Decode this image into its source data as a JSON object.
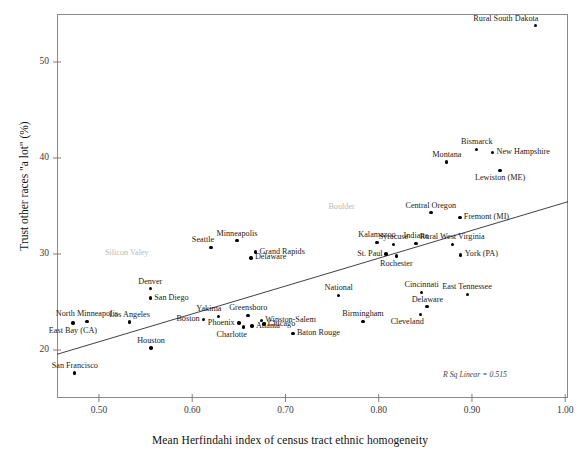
{
  "chart_data": {
    "type": "scatter",
    "title": "",
    "xlabel": "Mean Herfindahi index of census tract ethnic homogeneity",
    "ylabel": "Trust other races \"a lot\" (%)",
    "xlim": [
      0.455,
      1.003
    ],
    "ylim": [
      15.0,
      55.0
    ],
    "xticks": [
      "0.50",
      "0.60",
      "0.70",
      "0.80",
      "0.90",
      "1.00"
    ],
    "xtick_values": [
      0.5,
      0.6,
      0.7,
      0.8,
      0.9,
      1.0
    ],
    "yticks": [
      "20",
      "30",
      "40",
      "50"
    ],
    "ytick_values": [
      20,
      30,
      40,
      50
    ],
    "grid": false,
    "legend": null,
    "annotation": "R Sq Linear = 0.515",
    "fit_line": {
      "type": "linear",
      "x0": 0.455,
      "y0": 19.55,
      "x1": 1.003,
      "y1": 35.45
    },
    "points": [
      {
        "label": "Rural South Dakota",
        "x": 0.968,
        "y": 53.8,
        "pos": "above-left",
        "ghost": false
      },
      {
        "label": "Bismarck",
        "x": 0.905,
        "y": 40.9,
        "pos": "above",
        "ghost": false
      },
      {
        "label": "New Hampshire",
        "x": 0.922,
        "y": 40.6,
        "pos": "right",
        "ghost": false
      },
      {
        "label": "Montana",
        "x": 0.873,
        "y": 39.6,
        "pos": "above",
        "ghost": false
      },
      {
        "label": "Lewiston (ME)",
        "x": 0.93,
        "y": 38.7,
        "pos": "below",
        "ghost": false
      },
      {
        "label": "Boulder",
        "x": 0.76,
        "y": 35.0,
        "pos": "label-only",
        "ghost": true
      },
      {
        "label": "Central Oregon",
        "x": 0.856,
        "y": 34.3,
        "pos": "above",
        "ghost": false
      },
      {
        "label": "Fremont (MI)",
        "x": 0.887,
        "y": 33.8,
        "pos": "right",
        "ghost": false
      },
      {
        "label": "Minneapolis",
        "x": 0.648,
        "y": 31.4,
        "pos": "above",
        "ghost": false
      },
      {
        "label": "Kalamazoo",
        "x": 0.798,
        "y": 31.2,
        "pos": "above",
        "ghost": false
      },
      {
        "label": "Syracuse",
        "x": 0.816,
        "y": 31.0,
        "pos": "above",
        "ghost": false
      },
      {
        "label": "Indiana",
        "x": 0.84,
        "y": 31.1,
        "pos": "above",
        "ghost": false
      },
      {
        "label": "Rural West Virginia",
        "x": 0.879,
        "y": 31.0,
        "pos": "above",
        "ghost": false
      },
      {
        "label": "Seattle",
        "x": 0.62,
        "y": 30.7,
        "pos": "above-left",
        "ghost": false
      },
      {
        "label": "Silicon Valey",
        "x": 0.53,
        "y": 30.2,
        "pos": "label-only",
        "ghost": true
      },
      {
        "label": "Grand Rapids",
        "x": 0.668,
        "y": 30.2,
        "pos": "right",
        "ghost": false
      },
      {
        "label": "St. Paul",
        "x": 0.808,
        "y": 30.0,
        "pos": "left",
        "ghost": false
      },
      {
        "label": "York (PA)",
        "x": 0.888,
        "y": 29.9,
        "pos": "right",
        "ghost": false
      },
      {
        "label": "Delaware",
        "x": 0.663,
        "y": 29.6,
        "pos": "right",
        "ghost": false
      },
      {
        "label": "Rochester",
        "x": 0.819,
        "y": 29.8,
        "pos": "below",
        "ghost": false
      },
      {
        "label": "Denver",
        "x": 0.555,
        "y": 26.4,
        "pos": "above",
        "ghost": false
      },
      {
        "label": "Cincinnati",
        "x": 0.846,
        "y": 26.0,
        "pos": "above",
        "ghost": false
      },
      {
        "label": "East Tennessee",
        "x": 0.895,
        "y": 25.8,
        "pos": "above",
        "ghost": false
      },
      {
        "label": "National",
        "x": 0.757,
        "y": 25.7,
        "pos": "above",
        "ghost": false
      },
      {
        "label": "San Diego",
        "x": 0.555,
        "y": 25.4,
        "pos": "right",
        "ghost": false
      },
      {
        "label": "Delaware",
        "x": 0.852,
        "y": 24.5,
        "pos": "above",
        "ghost": false
      },
      {
        "label": "Greensboro",
        "x": 0.66,
        "y": 23.6,
        "pos": "above",
        "ghost": false
      },
      {
        "label": "Yakima",
        "x": 0.628,
        "y": 23.5,
        "pos": "above-left",
        "ghost": false
      },
      {
        "label": "Cleveland",
        "x": 0.845,
        "y": 23.7,
        "pos": "below-left",
        "ghost": false
      },
      {
        "label": "Boston",
        "x": 0.612,
        "y": 23.2,
        "pos": "left",
        "ghost": false
      },
      {
        "label": "Winston-Salem",
        "x": 0.674,
        "y": 23.1,
        "pos": "right",
        "ghost": false
      },
      {
        "label": "Birmingham",
        "x": 0.783,
        "y": 23.0,
        "pos": "above",
        "ghost": false
      },
      {
        "label": "North Minneapolis",
        "x": 0.487,
        "y": 23.0,
        "pos": "above",
        "ghost": false
      },
      {
        "label": "Los Angeles",
        "x": 0.533,
        "y": 22.9,
        "pos": "above",
        "ghost": false
      },
      {
        "label": "Phoenix",
        "x": 0.65,
        "y": 22.8,
        "pos": "left",
        "ghost": false
      },
      {
        "label": "Chicago",
        "x": 0.677,
        "y": 22.7,
        "pos": "right",
        "ghost": false
      },
      {
        "label": "Atlanta",
        "x": 0.664,
        "y": 22.5,
        "pos": "right",
        "ghost": false
      },
      {
        "label": "Charlotte",
        "x": 0.655,
        "y": 22.4,
        "pos": "below-left",
        "ghost": false
      },
      {
        "label": "East Bay (CA)",
        "x": 0.472,
        "y": 22.8,
        "pos": "below",
        "ghost": false
      },
      {
        "label": "Baton Rouge",
        "x": 0.708,
        "y": 21.7,
        "pos": "right",
        "ghost": false
      },
      {
        "label": "Houston",
        "x": 0.556,
        "y": 20.2,
        "pos": "above",
        "ghost": false
      },
      {
        "label": "San Francisco",
        "x": 0.474,
        "y": 17.6,
        "pos": "above",
        "ghost": false
      }
    ]
  },
  "axes": {
    "x_title": "Mean Herfindahi index of census tract ethnic homogeneity",
    "y_title": "Trust other races \"a lot\" (%)"
  },
  "annotation": {
    "rsq": "R Sq Linear = 0.515"
  }
}
